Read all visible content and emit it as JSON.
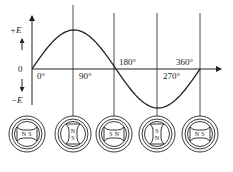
{
  "figure": {
    "colors": {
      "stroke": "#222222",
      "background": "#ffffff"
    }
  },
  "axis": {
    "y_labels": {
      "positive": "+E",
      "zero": "0",
      "negative": "−E"
    },
    "x_ticks": [
      {
        "label": "0°",
        "x": 32
      },
      {
        "label": "90°",
        "x": 73
      },
      {
        "label": "180°",
        "x": 114
      },
      {
        "label": "270°",
        "x": 157
      },
      {
        "label": "360°",
        "x": 200
      }
    ]
  },
  "curve": {
    "type": "sine",
    "points": [
      {
        "angle": 0,
        "value": 0
      },
      {
        "angle": 90,
        "value": 1
      },
      {
        "angle": 180,
        "value": 0
      },
      {
        "angle": 270,
        "value": -1
      },
      {
        "angle": 360,
        "value": 0
      }
    ]
  },
  "rotors": [
    {
      "angle": "0°",
      "orientation": "horizontal",
      "pole_a": "N",
      "pole_b": "S"
    },
    {
      "angle": "90°",
      "orientation": "vertical",
      "pole_a": "N",
      "pole_b": "S"
    },
    {
      "angle": "180°",
      "orientation": "horizontal",
      "pole_a": "S",
      "pole_b": "N"
    },
    {
      "angle": "270°",
      "orientation": "vertical",
      "pole_a": "S",
      "pole_b": "N"
    },
    {
      "angle": "360°",
      "orientation": "horizontal",
      "pole_a": "N",
      "pole_b": "S"
    }
  ]
}
